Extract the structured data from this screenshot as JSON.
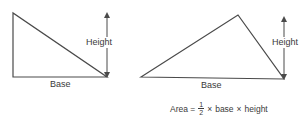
{
  "diagram": {
    "stroke_color": "#4a4a4a",
    "text_color": "#3a3a3a",
    "left_triangle": {
      "type": "right-triangle",
      "points": [
        [
          13,
          13
        ],
        [
          13,
          77
        ],
        [
          107,
          77
        ]
      ],
      "base_label": "Base",
      "height_label": "Height",
      "height_arrow": {
        "x": 107,
        "y_top": 13,
        "y_bottom": 77
      }
    },
    "right_triangle": {
      "type": "obtuse-triangle",
      "points": [
        [
          141,
          77
        ],
        [
          238,
          15
        ],
        [
          284,
          79
        ]
      ],
      "base_label": "Base",
      "height_label": "Height",
      "height_arrow": {
        "x": 284,
        "y_top": 17,
        "y_bottom": 79
      }
    },
    "formula": {
      "lhs": "Area =",
      "fraction_numerator": "1",
      "fraction_denominator": "2",
      "times1": "×",
      "term1": "base",
      "times2": "×",
      "term2": "height"
    }
  }
}
